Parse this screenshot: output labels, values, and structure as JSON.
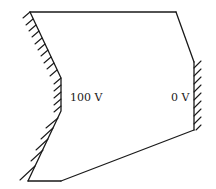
{
  "diagram": {
    "title": "",
    "labels": {
      "left_electrode": "100 V",
      "right_electrode": "0 V"
    },
    "colors": {
      "stroke": "#1a1a1a",
      "background": "#ffffff"
    },
    "vertices": {
      "top_left": [
        30,
        12
      ],
      "top_right": [
        176,
        12
      ],
      "right_upper": [
        194,
        62
      ],
      "right_lower": [
        194,
        130
      ],
      "bottom_right": [
        61,
        181
      ],
      "bottom_left": [
        28,
        181
      ],
      "left_mid": [
        61,
        111
      ],
      "left_upper": [
        61,
        78
      ]
    },
    "electrodes": [
      {
        "name": "left-electrode",
        "potential": "100 V",
        "side": "left"
      },
      {
        "name": "right-electrode",
        "potential": "0 V",
        "side": "right"
      }
    ]
  }
}
